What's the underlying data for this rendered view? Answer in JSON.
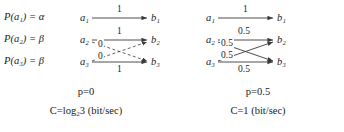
{
  "figure": {
    "panels": [
      {
        "id": "left",
        "probabilities": [
          {
            "text": "P(a",
            "sub": "1",
            "tail": ") = α"
          },
          {
            "text": "P(a",
            "sub": "2",
            "tail": ") = β"
          },
          {
            "text": "P(a",
            "sub": "3",
            "tail": ") = β"
          }
        ],
        "prob_labels": [
          "P(a₁) = α",
          "P(a₂) = β",
          "P(a₃) = β"
        ],
        "source_nodes": [
          "a₁",
          "a₂",
          "a₃"
        ],
        "target_nodes": [
          "b₁",
          "b₂",
          "b₃"
        ],
        "edge_labels": {
          "a1_b1": "1",
          "a2_b2": "1",
          "a3_b3": "1",
          "a2_b3": "0",
          "a3_b2": "0"
        },
        "caption_p": "p=0",
        "caption_c": "C=log",
        "caption_c_sub": "2",
        "caption_c_tail": "3 (bit/sec)",
        "caption_c_full": "C=log₂3 (bit/sec)"
      },
      {
        "id": "right",
        "source_nodes": [
          "a₁",
          "a₂",
          "a₃"
        ],
        "target_nodes": [
          "b₁",
          "b₂",
          "b₃"
        ],
        "edge_labels": {
          "a1_b1": "1",
          "a2_b2": "0.5",
          "a3_b3": "0.5",
          "a2_b3": "0.5",
          "a3_b2": "0.5"
        },
        "caption_p": "p=0.5",
        "caption_c_full": "C=1 (bit/sec)"
      }
    ],
    "colors": {
      "ink": "#1a1a1a",
      "edge": "#3a3a3a",
      "background": "#ffffff"
    }
  }
}
